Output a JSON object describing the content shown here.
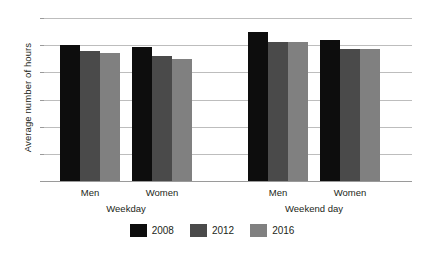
{
  "chart_data": {
    "type": "bar",
    "title": "",
    "xlabel": "",
    "ylabel": "Average number of hours",
    "ylim": [
      0,
      6
    ],
    "ytick_step": 1,
    "yticks": [
      "0",
      "1",
      "2",
      "3",
      "4",
      "5",
      "6"
    ],
    "grid": true,
    "legend_position": "bottom",
    "categories": [
      "Men",
      "Women",
      "Men",
      "Women"
    ],
    "groups": [
      {
        "section": "Weekday",
        "categories": [
          "Men",
          "Women"
        ]
      },
      {
        "section": "Weekend day",
        "categories": [
          "Men",
          "Women"
        ]
      }
    ],
    "series": [
      {
        "name": "2008",
        "color": "#0d0d0d",
        "values": [
          5.0,
          4.95,
          5.5,
          5.2
        ]
      },
      {
        "name": "2012",
        "color": "#4a4a4a",
        "values": [
          4.8,
          4.6,
          5.1,
          4.85
        ]
      },
      {
        "name": "2016",
        "color": "#808080",
        "values": [
          4.7,
          4.5,
          5.1,
          4.85
        ]
      }
    ],
    "section_labels": [
      "Weekday",
      "Weekend day"
    ],
    "legend_entries": [
      {
        "label": "2008",
        "color": "#0d0d0d"
      },
      {
        "label": "2012",
        "color": "#4a4a4a"
      },
      {
        "label": "2016",
        "color": "#808080"
      }
    ],
    "axis_colors": {
      "gridline": "#bdbdbd",
      "baseline": "#9a9a9a",
      "text": "#231f20",
      "background": "#ffffff"
    }
  }
}
